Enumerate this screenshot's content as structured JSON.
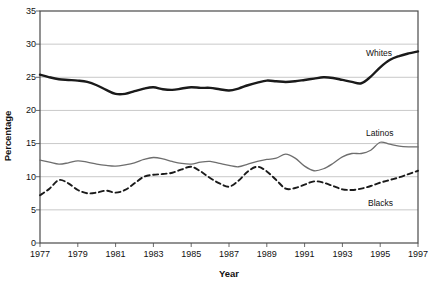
{
  "chart_data": {
    "type": "line",
    "title": "",
    "xlabel": "Year",
    "ylabel": "Percentage",
    "xlim": [
      1977,
      1997
    ],
    "ylim": [
      0,
      35
    ],
    "grid": true,
    "legend_position": "inline-right",
    "yticks": [
      0,
      5,
      10,
      15,
      20,
      25,
      30,
      35
    ],
    "ytick_labels": [
      "0",
      "5",
      "10",
      "15",
      "20",
      "25",
      "30",
      "35"
    ],
    "xticks": [
      1977,
      1979,
      1981,
      1983,
      1985,
      1987,
      1989,
      1991,
      1993,
      1995,
      1997
    ],
    "xtick_labels": [
      "1977",
      "1979",
      "1981",
      "1983",
      "1985",
      "1987",
      "1989",
      "1991",
      "1993",
      "1995",
      "1997"
    ],
    "x": [
      1977,
      1977.5,
      1978,
      1978.5,
      1979,
      1979.5,
      1980,
      1980.5,
      1981,
      1981.5,
      1982,
      1982.5,
      1983,
      1983.5,
      1984,
      1984.5,
      1985,
      1985.5,
      1986,
      1986.5,
      1987,
      1987.5,
      1988,
      1988.5,
      1989,
      1989.5,
      1990,
      1990.5,
      1991,
      1991.5,
      1992,
      1992.5,
      1993,
      1993.5,
      1994,
      1994.5,
      1995,
      1995.5,
      1996,
      1996.5,
      1997
    ],
    "series": [
      {
        "name": "Whites",
        "style": "solid-thick-black",
        "color": "#1a1a1a",
        "values": [
          25.4,
          25.0,
          24.7,
          24.6,
          24.5,
          24.3,
          23.8,
          23.1,
          22.5,
          22.5,
          22.9,
          23.3,
          23.5,
          23.2,
          23.1,
          23.3,
          23.5,
          23.4,
          23.4,
          23.2,
          23.0,
          23.3,
          23.8,
          24.2,
          24.5,
          24.4,
          24.3,
          24.4,
          24.6,
          24.8,
          25.0,
          24.9,
          24.6,
          24.3,
          24.1,
          25.1,
          26.5,
          27.6,
          28.2,
          28.6,
          28.9
        ]
      },
      {
        "name": "Latinos",
        "style": "solid-thin-gray",
        "color": "#6e6e6e",
        "values": [
          12.5,
          12.2,
          11.9,
          12.1,
          12.4,
          12.2,
          11.9,
          11.7,
          11.6,
          11.8,
          12.1,
          12.6,
          12.9,
          12.7,
          12.3,
          12.0,
          11.9,
          12.2,
          12.3,
          12.0,
          11.7,
          11.5,
          11.9,
          12.3,
          12.6,
          12.8,
          13.4,
          12.8,
          11.6,
          10.9,
          11.2,
          12.0,
          13.0,
          13.5,
          13.5,
          14.0,
          15.2,
          14.9,
          14.6,
          14.5,
          14.5
        ]
      },
      {
        "name": "Blacks",
        "style": "dashed-black",
        "color": "#1a1a1a",
        "values": [
          7.2,
          8.2,
          9.5,
          9.0,
          8.0,
          7.5,
          7.6,
          7.9,
          7.6,
          8.0,
          9.0,
          10.0,
          10.3,
          10.4,
          10.6,
          11.1,
          11.5,
          10.8,
          9.8,
          9.0,
          8.5,
          9.4,
          10.8,
          11.5,
          10.8,
          9.5,
          8.2,
          8.3,
          8.8,
          9.3,
          9.1,
          8.6,
          8.1,
          8.0,
          8.2,
          8.6,
          9.1,
          9.5,
          9.9,
          10.4,
          10.9
        ]
      }
    ]
  },
  "labels": {
    "whites": "Whites",
    "latinos": "Latinos",
    "blacks": "Blacks"
  }
}
